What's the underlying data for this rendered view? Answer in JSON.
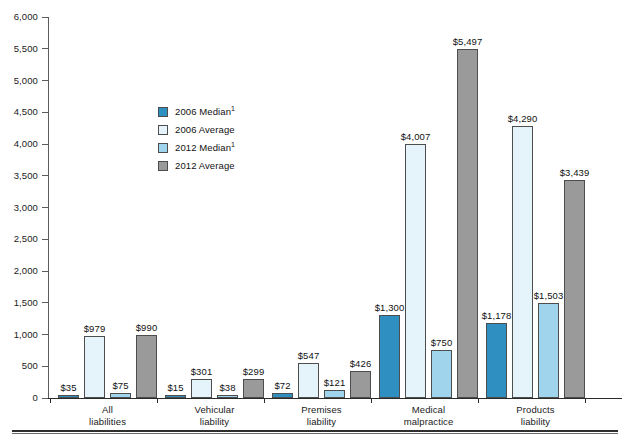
{
  "chart_data": {
    "type": "bar",
    "title": "",
    "subtitle": "",
    "xlabel": "",
    "ylabel": "",
    "ylim": [
      0,
      6000
    ],
    "ytick_values": [
      0,
      500,
      1000,
      1500,
      2000,
      2500,
      3000,
      3500,
      4000,
      4500,
      5000,
      5500,
      6000
    ],
    "ytick_labels": [
      "0",
      "500",
      "1,000",
      "1,500",
      "2,000",
      "2,500",
      "3,000",
      "3,500",
      "4,000",
      "4,500",
      "5,000",
      "5,500",
      "6,000"
    ],
    "grid": false,
    "legend_position": "upper-left-inside",
    "categories": [
      "All liabilities",
      "Vehicular liability",
      "Premises liability",
      "Medical malpractice",
      "Products liability"
    ],
    "category_lines": [
      [
        "All",
        "liabilities"
      ],
      [
        "Vehicular",
        "liability"
      ],
      [
        "Premises",
        "liability"
      ],
      [
        "Medical",
        "malpractice"
      ],
      [
        "Products",
        "liability"
      ]
    ],
    "series": [
      {
        "name": "2006 Median",
        "footnote_marker": "1",
        "color": "#2E8FC0",
        "values": [
          35,
          15,
          72,
          1300,
          1178
        ],
        "labels": [
          "$35",
          "$15",
          "$72",
          "$1,300",
          "$1,178"
        ]
      },
      {
        "name": "2006 Average",
        "footnote_marker": "",
        "color": "#E4F4FA",
        "values": [
          979,
          301,
          547,
          4007,
          4290
        ],
        "labels": [
          "$979",
          "$301",
          "$547",
          "$4,007",
          "$4,290"
        ]
      },
      {
        "name": "2012 Median",
        "footnote_marker": "1",
        "color": "#9FD4EC",
        "values": [
          75,
          38,
          121,
          750,
          1503
        ],
        "labels": [
          "$75",
          "$38",
          "$121",
          "$750",
          "$1,503"
        ]
      },
      {
        "name": "2012 Average",
        "footnote_marker": "",
        "color": "#9A9A9A",
        "values": [
          990,
          299,
          426,
          5497,
          3439
        ],
        "labels": [
          "$990",
          "$299",
          "$426",
          "$5,497",
          "$3,439"
        ]
      }
    ]
  },
  "legend": {
    "items": [
      {
        "label": "2006 Median",
        "sup": "1",
        "color": "#2E8FC0"
      },
      {
        "label": "2006 Average",
        "sup": "",
        "color": "#E4F4FA"
      },
      {
        "label": "2012 Median",
        "sup": "1",
        "color": "#9FD4EC"
      },
      {
        "label": "2012 Average",
        "sup": "",
        "color": "#9A9A9A"
      }
    ]
  },
  "axis": {
    "line_color": "#5c5c5c",
    "baseline_color": "#2a2a2a"
  }
}
